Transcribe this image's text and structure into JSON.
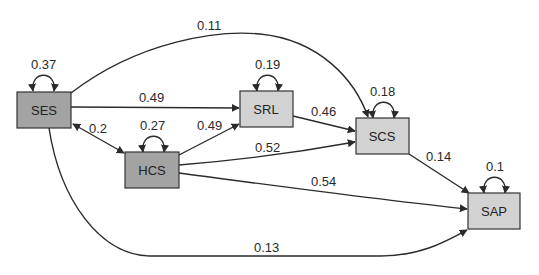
{
  "diagram": {
    "type": "path-model",
    "colors": {
      "exogenous_fill": "#a3a3a3",
      "endogenous_fill": "#d2d2d2",
      "stroke": "#2b2b2b",
      "background": "#ffffff"
    },
    "nodes": [
      {
        "id": "SES",
        "label": "SES",
        "variance": "0.37",
        "kind": "exogenous"
      },
      {
        "id": "HCS",
        "label": "HCS",
        "variance": "0.27",
        "kind": "exogenous"
      },
      {
        "id": "SRL",
        "label": "SRL",
        "variance": "0.19",
        "kind": "endogenous"
      },
      {
        "id": "SCS",
        "label": "SCS",
        "variance": "0.18",
        "kind": "endogenous"
      },
      {
        "id": "SAP",
        "label": "SAP",
        "variance": "0.1",
        "kind": "endogenous"
      }
    ],
    "edges": [
      {
        "from": "SES",
        "to": "SCS",
        "label": "0.11",
        "directed": true
      },
      {
        "from": "SES",
        "to": "SRL",
        "label": "0.49",
        "directed": true
      },
      {
        "from": "SES",
        "to": "HCS",
        "label": "0.2",
        "directed": false,
        "bidirectional": true
      },
      {
        "from": "HCS",
        "to": "SRL",
        "label": "0.49",
        "directed": true
      },
      {
        "from": "SRL",
        "to": "SCS",
        "label": "0.46",
        "directed": true
      },
      {
        "from": "HCS",
        "to": "SCS",
        "label": "0.52",
        "directed": true
      },
      {
        "from": "SCS",
        "to": "SAP",
        "label": "0.14",
        "directed": true
      },
      {
        "from": "HCS",
        "to": "SAP",
        "label": "0.54",
        "directed": true
      },
      {
        "from": "SES",
        "to": "SAP",
        "label": "0.13",
        "directed": true
      }
    ]
  }
}
